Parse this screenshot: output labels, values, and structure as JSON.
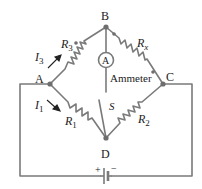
{
  "diagram": {
    "type": "wheatstone-bridge-circuit",
    "nodes": {
      "A": "A",
      "B": "B",
      "C": "C",
      "D": "D"
    },
    "resistors": {
      "R1": {
        "name": "R",
        "sub": "1",
        "between": "A-D"
      },
      "R2": {
        "name": "R",
        "sub": "2",
        "between": "D-C"
      },
      "R3": {
        "name": "R",
        "sub": "3",
        "between": "A-B"
      },
      "Rx": {
        "name": "R",
        "sub": "x",
        "between": "B-C"
      }
    },
    "currents": {
      "I1": {
        "name": "I",
        "sub": "1"
      },
      "I3": {
        "name": "I",
        "sub": "3"
      }
    },
    "ammeter": {
      "symbol": "A",
      "label": "Ammeter"
    },
    "switch": {
      "label": "S"
    },
    "battery": {
      "plus": "+",
      "minus": "−"
    },
    "colors": {
      "wire": "#7a7a7a",
      "node": "#6e6e6e",
      "text": "#222222",
      "background": "#ffffff"
    }
  }
}
